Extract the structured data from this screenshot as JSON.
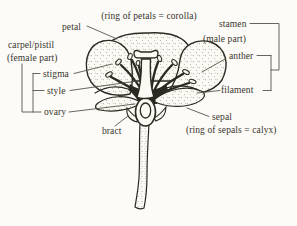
{
  "diagram": {
    "corolla_note": "(ring of petals = corolla)",
    "calyx_note": "(ring of sepals = calyx)",
    "labels": {
      "petal": "petal",
      "carpel_pistil": "carpel/pistil",
      "female_part": "(female part)",
      "stigma": "stigma",
      "style": "style",
      "ovary": "ovary",
      "bract": "bract",
      "stamen": "stamen",
      "male_part": "(male part)",
      "anther": "anther",
      "filament": "filament",
      "sepal": "sepal"
    },
    "groupings": {
      "left_bracket": "carpel/pistil (female part) = stigma + style + ovary",
      "right_bracket": "stamen (male part) = anther + filament"
    },
    "colors": {
      "ink": "#2b2921",
      "paper": "#fcfbf8",
      "leader_line": "#57534a",
      "text": "#37342c"
    }
  }
}
